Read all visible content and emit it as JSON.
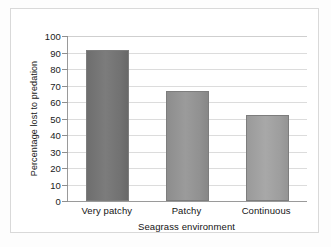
{
  "chart_data": {
    "type": "bar",
    "title": "",
    "subtitle": "",
    "xlabel": "Seagrass environment",
    "ylabel": "Percentage lost to predation",
    "categories": [
      "Very patchy",
      "Patchy",
      "Continuous"
    ],
    "values": [
      91.5,
      66.5,
      52
    ],
    "ylim": [
      0,
      100
    ],
    "ytick_step": 10,
    "yticks": [
      "100",
      "90",
      "80",
      "70",
      "60",
      "50",
      "40",
      "30",
      "20",
      "10",
      "0"
    ],
    "grid": "horizontal",
    "legend": "none",
    "bar_colors": [
      "#6e6e6e",
      "#8d8d8d",
      "#9a9a9a"
    ],
    "series": [
      {
        "name": "Percentage lost to predation",
        "values": [
          91.5,
          66.5,
          52
        ]
      }
    ]
  },
  "figure": {
    "frame_color": "#d9d9d9",
    "axis_color": "#9a9a9a",
    "gridline_color": "#dcdcdc",
    "background": "#ffffff"
  }
}
